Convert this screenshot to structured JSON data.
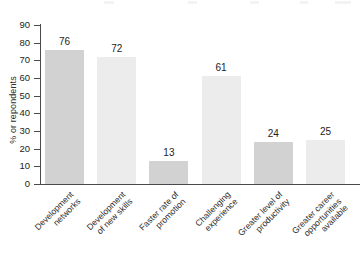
{
  "chart_data": {
    "type": "bar",
    "title": "",
    "xlabel": "",
    "ylabel": "% or repondents",
    "ylim": [
      0,
      90
    ],
    "grid": false,
    "legend": "none",
    "categories": [
      "Development networks",
      "Development of new skills",
      "Faster rate of promotion",
      "Challenging experience",
      "Greater level of productivity",
      "Greater career opportunities available"
    ],
    "category_lines": [
      [
        "Development",
        "networks"
      ],
      [
        "Development",
        "of new skills"
      ],
      [
        "Faster rate of",
        "promotion"
      ],
      [
        "Challenging",
        "experience"
      ],
      [
        "Greater level of",
        "productivity"
      ],
      [
        "Greater career",
        "opportunities",
        "available"
      ]
    ],
    "values": [
      76,
      72,
      13,
      61,
      24,
      25
    ],
    "value_labels": [
      "76",
      "72",
      "13",
      "61",
      "24",
      "25"
    ],
    "y_ticks": [
      0,
      10,
      20,
      30,
      40,
      50,
      60,
      70,
      80,
      90
    ],
    "y_tick_labels": [
      "0",
      "10",
      "20",
      "30",
      "40",
      "50",
      "60",
      "70",
      "80",
      "90"
    ],
    "bar_colors": [
      "#d2d2d2",
      "#ececec",
      "#d2d2d2",
      "#ececec",
      "#d2d2d2",
      "#ececec"
    ],
    "axis_color": "#4a4a4a",
    "text_color": "#1d1d1d",
    "background": "#ffffff"
  }
}
